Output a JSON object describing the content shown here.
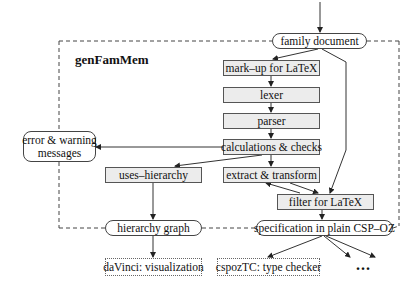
{
  "diagram": {
    "frame_title": "genFamMem",
    "nodes": {
      "family_document": "family document",
      "markup": "mark–up for LaTeX",
      "lexer": "lexer",
      "parser": "parser",
      "calculations": "calculations & checks",
      "extract": "extract & transform",
      "filter": "filter for LaTeX",
      "uses_hierarchy": "uses–hierarchy",
      "error_line1": "error & warning",
      "error_line2": "messages",
      "hierarchy_graph": "hierarchy graph",
      "specification": "specification in plain CSP–OZ",
      "davinci": "daVinci: visualization",
      "cspoztc": "cspozTC: type checker",
      "more": "..."
    },
    "colors": {
      "process_fill": "#ececec",
      "border": "#555555",
      "line": "#333333",
      "background": "#ffffff"
    }
  }
}
